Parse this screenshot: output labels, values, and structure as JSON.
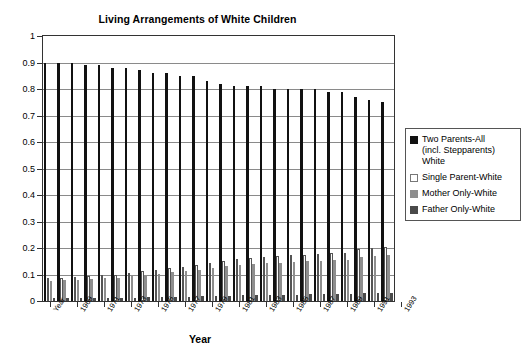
{
  "chart_data": {
    "type": "bar",
    "title": "Living Arrangements of White Children",
    "xlabel": "Year",
    "ylabel": "",
    "ylim": [
      0,
      1
    ],
    "grid": true,
    "legend_position": "right",
    "ytick_labels": [
      "1",
      "0.9",
      "0.8",
      "0.7",
      "0.6",
      "0.5",
      "0.4",
      "0.3",
      "0.2",
      "0.1",
      "0"
    ],
    "ytick_values": [
      1,
      0.9,
      0.8,
      0.7,
      0.6,
      0.5,
      0.4,
      0.3,
      0.2,
      0.1,
      0
    ],
    "categories": [
      "Year",
      "1969",
      "1970",
      "1971",
      "1972",
      "1973",
      "1974",
      "1975",
      "1976",
      "1977",
      "1978",
      "1979",
      "1980",
      "1981",
      "1982",
      "1983",
      "1984",
      "1985",
      "1986",
      "1987",
      "1988",
      "1989",
      "1990",
      "1991",
      "1992",
      "1993"
    ],
    "xtick_labels": [
      "Year",
      "1969",
      "1971",
      "1973",
      "1975",
      "1977",
      "1979",
      "1981",
      "1983",
      "1985",
      "1987",
      "1989",
      "1991",
      "1993"
    ],
    "series": [
      {
        "name": "Two Parents-All (incl. Stepparents) White",
        "color": "#111111",
        "values": [
          0.9,
          0.9,
          0.9,
          0.89,
          0.89,
          0.88,
          0.88,
          0.87,
          0.86,
          0.86,
          0.85,
          0.85,
          0.83,
          0.82,
          0.81,
          0.81,
          0.81,
          0.8,
          0.8,
          0.8,
          0.8,
          0.79,
          0.79,
          0.77,
          0.76,
          0.75
        ]
      },
      {
        "name": "Single Parent-White",
        "color": "#ffffff",
        "values": [
          0.085,
          0.088,
          0.09,
          0.093,
          0.097,
          0.1,
          0.105,
          0.112,
          0.118,
          0.123,
          0.13,
          0.135,
          0.145,
          0.152,
          0.158,
          0.163,
          0.165,
          0.168,
          0.172,
          0.175,
          0.178,
          0.18,
          0.183,
          0.195,
          0.2,
          0.205
        ]
      },
      {
        "name": "Mother Only-White",
        "color": "#8e8e8e",
        "values": [
          0.075,
          0.078,
          0.08,
          0.082,
          0.085,
          0.088,
          0.093,
          0.098,
          0.103,
          0.108,
          0.113,
          0.118,
          0.126,
          0.132,
          0.137,
          0.141,
          0.143,
          0.145,
          0.148,
          0.15,
          0.152,
          0.154,
          0.156,
          0.166,
          0.17,
          0.174
        ]
      },
      {
        "name": "Father Only-White",
        "color": "#4a4a4a",
        "values": [
          0.01,
          0.011,
          0.011,
          0.012,
          0.012,
          0.013,
          0.013,
          0.014,
          0.015,
          0.016,
          0.017,
          0.018,
          0.019,
          0.02,
          0.021,
          0.022,
          0.023,
          0.023,
          0.024,
          0.025,
          0.026,
          0.026,
          0.027,
          0.029,
          0.03,
          0.031
        ]
      }
    ]
  },
  "legend": {
    "items": [
      {
        "label": "Two Parents-All\n(incl. Stepparents)\nWhite",
        "swatch": "s0"
      },
      {
        "label": "Single Parent-White",
        "swatch": "s1"
      },
      {
        "label": "Mother Only-White",
        "swatch": "s2"
      },
      {
        "label": "Father Only-White",
        "swatch": "s3"
      }
    ]
  }
}
